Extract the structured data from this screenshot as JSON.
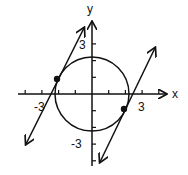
{
  "diagram": {
    "type": "coordinate-plane-graph",
    "axes": {
      "x_label": "x",
      "y_label": "y",
      "x_tick_label_neg": "-3",
      "x_tick_label_pos": "3",
      "y_tick_label_pos": "3",
      "y_tick_label_neg": "-3",
      "tick_spacing_units": 1,
      "x_range": [
        -4,
        4
      ],
      "y_range": [
        -4,
        4
      ]
    },
    "circle": {
      "center": [
        0,
        0
      ],
      "radius": "√5"
    },
    "lines": [
      {
        "equation": "y = 2x + 5",
        "slope": 2,
        "intercept": 5
      },
      {
        "equation": "y = 2x - 5",
        "slope": 2,
        "intercept": -5
      }
    ],
    "tangent_points": [
      {
        "x": -2,
        "y": 1
      },
      {
        "x": 2,
        "y": -1
      }
    ],
    "stroke_color": "#111111"
  }
}
